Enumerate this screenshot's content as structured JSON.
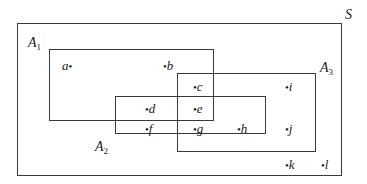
{
  "diagram": {
    "type": "venn-rectangles",
    "universe": {
      "label": "S",
      "box": {
        "x": 17,
        "y": 23,
        "w": 325,
        "h": 153
      },
      "label_pos": {
        "x": 345,
        "y": 8
      }
    },
    "sets": [
      {
        "id": "A1",
        "name": "A",
        "sub": "1",
        "box": {
          "x": 49,
          "y": 49,
          "w": 165,
          "h": 72
        },
        "label_pos": {
          "x": 28,
          "y": 36
        }
      },
      {
        "id": "A2",
        "name": "A",
        "sub": "2",
        "box": {
          "x": 115,
          "y": 96,
          "w": 151,
          "h": 38
        },
        "label_pos": {
          "x": 95,
          "y": 140
        }
      },
      {
        "id": "A3",
        "name": "A",
        "sub": "3",
        "box": {
          "x": 177,
          "y": 73,
          "w": 139,
          "h": 79
        },
        "label_pos": {
          "x": 320,
          "y": 61
        }
      }
    ],
    "points": [
      {
        "label": "a",
        "dot_side": "right",
        "x": 62,
        "y": 59,
        "membership": [
          "A1"
        ]
      },
      {
        "label": "b",
        "dot_side": "left",
        "x": 163,
        "y": 59,
        "membership": [
          "A1"
        ]
      },
      {
        "label": "c",
        "dot_side": "left",
        "x": 193,
        "y": 80,
        "membership": [
          "A1",
          "A3"
        ]
      },
      {
        "label": "d",
        "dot_side": "left",
        "x": 145,
        "y": 102,
        "membership": [
          "A1",
          "A2"
        ]
      },
      {
        "label": "e",
        "dot_side": "left",
        "x": 193,
        "y": 102,
        "membership": [
          "A1",
          "A2",
          "A3"
        ]
      },
      {
        "label": "f",
        "dot_side": "left",
        "x": 145,
        "y": 122,
        "membership": [
          "A2"
        ]
      },
      {
        "label": "g",
        "dot_side": "left",
        "x": 193,
        "y": 122,
        "membership": [
          "A2",
          "A3"
        ]
      },
      {
        "label": "h",
        "dot_side": "left",
        "x": 237,
        "y": 122,
        "membership": [
          "A2",
          "A3"
        ]
      },
      {
        "label": "i",
        "dot_side": "left",
        "x": 285,
        "y": 80,
        "membership": [
          "A3"
        ]
      },
      {
        "label": "j",
        "dot_side": "left",
        "x": 285,
        "y": 122,
        "membership": [
          "A3"
        ]
      },
      {
        "label": "k",
        "dot_side": "left",
        "x": 285,
        "y": 158,
        "membership": []
      },
      {
        "label": "l",
        "dot_side": "left",
        "x": 321,
        "y": 158,
        "membership": []
      }
    ]
  }
}
